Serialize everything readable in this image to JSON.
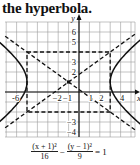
{
  "title": "the hyperbola.",
  "chart_data": {
    "type": "line",
    "title": "",
    "xlabel": "x",
    "ylabel": "y",
    "xlim": [
      -7,
      5.5
    ],
    "ylim": [
      -4.5,
      7
    ],
    "grid": true,
    "x_tick_labels": [
      "-6",
      "-2",
      "-1",
      "1",
      "2",
      "4"
    ],
    "y_tick_labels": [
      "6",
      "5",
      "3",
      "2",
      "-3",
      "-4"
    ],
    "equation": "(x + 1)^2/16 - (y - 1)^2/9 = 1",
    "center": [
      -1,
      1
    ],
    "a": 4,
    "b": 3,
    "vertices": [
      [
        -5,
        1
      ],
      [
        3,
        1
      ]
    ],
    "fundamental_rectangle": [
      [
        -5,
        4
      ],
      [
        3,
        4
      ],
      [
        3,
        -2
      ],
      [
        -5,
        -2
      ]
    ],
    "asymptotes": [
      "y - 1 = 3/4 (x + 1)",
      "y - 1 = -3/4 (x + 1)"
    ],
    "series": [
      {
        "name": "hyperbola left branch",
        "style": "solid"
      },
      {
        "name": "hyperbola right branch",
        "style": "solid"
      },
      {
        "name": "asymptotes",
        "style": "dashed"
      },
      {
        "name": "fundamental rectangle",
        "style": "dashed"
      }
    ]
  },
  "equation": {
    "term1_num": "(x + 1)²",
    "term1_den": "16",
    "minus": "−",
    "term2_num": "(y − 1)²",
    "term2_den": "9",
    "equals": "= 1"
  },
  "axes": {
    "x_name": "x",
    "y_name": "y",
    "x_labels": [
      {
        "v": -6,
        "t": "-6"
      },
      {
        "v": -2,
        "t": "−2"
      },
      {
        "v": -1,
        "t": "−1"
      },
      {
        "v": 1,
        "t": "1"
      },
      {
        "v": 2,
        "t": "2"
      },
      {
        "v": 4,
        "t": "4"
      }
    ],
    "y_labels": [
      {
        "v": 6,
        "t": "6"
      },
      {
        "v": 5,
        "t": "5"
      },
      {
        "v": 3,
        "t": "3"
      },
      {
        "v": 2,
        "t": "2"
      },
      {
        "v": -3,
        "t": "−3"
      },
      {
        "v": -4,
        "t": "−4"
      }
    ]
  }
}
